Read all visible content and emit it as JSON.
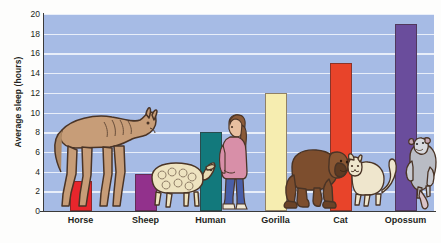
{
  "chart_data": {
    "type": "bar",
    "title": "",
    "xlabel": "",
    "ylabel": "Average sleep (hours)",
    "categories": [
      "Horse",
      "Sheep",
      "Human",
      "Gorilla",
      "Cat",
      "Opossum"
    ],
    "values": [
      3,
      3.8,
      8,
      12,
      15,
      19
    ],
    "ylim": [
      0,
      20
    ],
    "yticks": [
      0,
      2,
      4,
      6,
      8,
      10,
      12,
      14,
      16,
      18,
      20
    ],
    "ytick_labels": [
      "0",
      "2",
      "4",
      "6",
      "8",
      "10",
      "12",
      "14",
      "16",
      "18",
      "20"
    ],
    "grid": true,
    "legend": false,
    "bar_colors": [
      "#e8262c",
      "#92318c",
      "#12797c",
      "#f6edb0",
      "#e8442a",
      "#6a4d9c"
    ],
    "plot_background": "#a6bbe5",
    "gridline_color": "#eef2fb",
    "axis_color": "#3a3a3a",
    "annotations": [
      {
        "name": "horse-illustration",
        "category": "Horse"
      },
      {
        "name": "sheep-illustration",
        "category": "Sheep"
      },
      {
        "name": "human-illustration",
        "category": "Human"
      },
      {
        "name": "gorilla-illustration",
        "category": "Gorilla"
      },
      {
        "name": "cat-illustration",
        "category": "Cat"
      },
      {
        "name": "opossum-illustration",
        "category": "Opossum"
      }
    ]
  }
}
